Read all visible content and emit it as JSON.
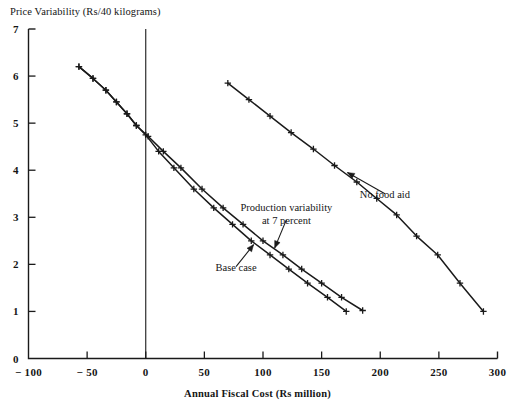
{
  "figure": {
    "background_color": "#ffffff",
    "ink_color": "#1a1a1a",
    "top_bleed_text": "— —— ——— —— ———— —— ——— —"
  },
  "chart_data": {
    "type": "line",
    "title": "",
    "ylabel": "Price Variability (Rs/40 kilograms)",
    "xlabel": "Annual Fiscal Cost (Rs million)",
    "xlim": [
      -100,
      300
    ],
    "ylim": [
      0,
      7
    ],
    "xticks": [
      -100,
      -50,
      0,
      50,
      100,
      150,
      200,
      250,
      300
    ],
    "xticklabels": [
      "− 100",
      "− 50",
      "0",
      "50",
      "100",
      "150",
      "200",
      "250",
      "300"
    ],
    "yticks": [
      0,
      1,
      2,
      3,
      4,
      5,
      6,
      7
    ],
    "yticklabels": [
      "0",
      "1",
      "2",
      "3",
      "4",
      "5",
      "6",
      "7"
    ],
    "grid": false,
    "legend": "none",
    "marker": "plus",
    "reference_lines": [
      {
        "name": "zero-fiscal-cost",
        "orientation": "vertical",
        "x": 0
      }
    ],
    "series": [
      {
        "name": "Base case",
        "points": [
          {
            "x": -57,
            "y": 6.2
          },
          {
            "x": -45,
            "y": 5.95
          },
          {
            "x": -34,
            "y": 5.7
          },
          {
            "x": -25,
            "y": 5.45
          },
          {
            "x": -16,
            "y": 5.2
          },
          {
            "x": -8,
            "y": 4.95
          },
          {
            "x": 0,
            "y": 4.75
          },
          {
            "x": 11,
            "y": 4.4
          },
          {
            "x": 24,
            "y": 4.05
          },
          {
            "x": 41,
            "y": 3.6
          },
          {
            "x": 58,
            "y": 3.2
          },
          {
            "x": 74,
            "y": 2.85
          },
          {
            "x": 90,
            "y": 2.5
          },
          {
            "x": 106,
            "y": 2.2
          },
          {
            "x": 122,
            "y": 1.9
          },
          {
            "x": 138,
            "y": 1.6
          },
          {
            "x": 155,
            "y": 1.3
          },
          {
            "x": 171,
            "y": 1.0
          }
        ]
      },
      {
        "name": "Production variability at 7 percent",
        "points": [
          {
            "x": -57,
            "y": 6.2
          },
          {
            "x": -45,
            "y": 5.95
          },
          {
            "x": -34,
            "y": 5.7
          },
          {
            "x": -25,
            "y": 5.45
          },
          {
            "x": -16,
            "y": 5.2
          },
          {
            "x": -8,
            "y": 4.95
          },
          {
            "x": 2,
            "y": 4.72
          },
          {
            "x": 15,
            "y": 4.4
          },
          {
            "x": 30,
            "y": 4.05
          },
          {
            "x": 48,
            "y": 3.6
          },
          {
            "x": 66,
            "y": 3.2
          },
          {
            "x": 83,
            "y": 2.85
          },
          {
            "x": 100,
            "y": 2.5
          },
          {
            "x": 117,
            "y": 2.2
          },
          {
            "x": 133,
            "y": 1.9
          },
          {
            "x": 150,
            "y": 1.6
          },
          {
            "x": 167,
            "y": 1.3
          },
          {
            "x": 185,
            "y": 1.02
          }
        ]
      },
      {
        "name": "No food aid",
        "points": [
          {
            "x": 70,
            "y": 5.85
          },
          {
            "x": 88,
            "y": 5.5
          },
          {
            "x": 106,
            "y": 5.15
          },
          {
            "x": 124,
            "y": 4.8
          },
          {
            "x": 143,
            "y": 4.45
          },
          {
            "x": 161,
            "y": 4.1
          },
          {
            "x": 180,
            "y": 3.75
          },
          {
            "x": 197,
            "y": 3.4
          },
          {
            "x": 214,
            "y": 3.05
          },
          {
            "x": 231,
            "y": 2.6
          },
          {
            "x": 249,
            "y": 2.2
          },
          {
            "x": 268,
            "y": 1.6
          },
          {
            "x": 288,
            "y": 1.0
          }
        ]
      }
    ],
    "annotations": [
      {
        "name": "no-food-aid-label",
        "lines": [
          "No food aid"
        ],
        "text_x": 204,
        "text_y": 3.5,
        "arrow_to_x": 172,
        "arrow_to_y": 3.95
      },
      {
        "name": "production-variability-label",
        "lines": [
          "Production variability",
          "at 7 percent"
        ],
        "text_x": 120,
        "text_y": 2.95,
        "arrow_to_x": 110,
        "arrow_to_y": 2.35
      },
      {
        "name": "base-case-label",
        "lines": [
          "Base case"
        ],
        "text_x": 77,
        "text_y": 1.95,
        "arrow_to_x": 92,
        "arrow_to_y": 2.42
      }
    ]
  }
}
